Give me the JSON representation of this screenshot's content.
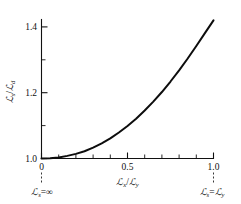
{
  "figure": {
    "background_color": "#ffffff",
    "line_color": "#0d0d0d",
    "axis_color": "#111111"
  },
  "axes": {
    "x": {
      "title_num": "ℒ",
      "title_num_sub": "x",
      "title_slash": "/",
      "title_den": "ℒ",
      "title_den_sub": "y",
      "tick_labels": [
        "0",
        "0.5",
        "1.0"
      ],
      "tick_values": [
        0,
        0.5,
        1.0
      ],
      "minor_tick_values": [
        0.1,
        0.2,
        0.3,
        0.4,
        0.6,
        0.7,
        0.8,
        0.9
      ],
      "range": [
        0,
        1.0
      ]
    },
    "y": {
      "title_num": "ℒ",
      "title_num_sub": "s",
      "title_slash": "/",
      "title_den": "ℒ",
      "title_den_sub": "d",
      "tick_labels": [
        "1.0",
        "1.2",
        "1.4"
      ],
      "tick_values": [
        1.0,
        1.2,
        1.4
      ],
      "minor_tick_values": [
        1.05,
        1.1,
        1.15,
        1.25,
        1.3,
        1.35
      ],
      "range": [
        1.0,
        1.42
      ]
    }
  },
  "annotations": [
    {
      "id": "left-endpoint",
      "sym": "ℒ",
      "sub": "s",
      "eq": "=",
      "value": "∞",
      "at_x": 0
    },
    {
      "id": "right-endpoint",
      "sym": "ℒ",
      "sub": "s",
      "eq": "=",
      "value_sym": "ℒ",
      "value_sub": "y",
      "at_x": 1.0
    }
  ],
  "chart_data": {
    "type": "line",
    "title": "",
    "xlabel": "ℒx / ℒy",
    "ylabel": "ℒs / ℒd",
    "xlim": [
      0,
      1.0
    ],
    "ylim": [
      1.0,
      1.42
    ],
    "grid": false,
    "legend": null,
    "series": [
      {
        "name": "Ls/Ld vs Lx/Ly",
        "x": [
          0.0,
          0.05,
          0.1,
          0.15,
          0.2,
          0.25,
          0.3,
          0.35,
          0.4,
          0.45,
          0.5,
          0.55,
          0.6,
          0.65,
          0.7,
          0.75,
          0.8,
          0.85,
          0.9,
          0.95,
          1.0
        ],
        "y": [
          1.0,
          1.001,
          1.003,
          1.008,
          1.014,
          1.022,
          1.033,
          1.046,
          1.061,
          1.079,
          1.099,
          1.121,
          1.146,
          1.173,
          1.202,
          1.234,
          1.268,
          1.304,
          1.342,
          1.381,
          1.42
        ]
      }
    ]
  }
}
